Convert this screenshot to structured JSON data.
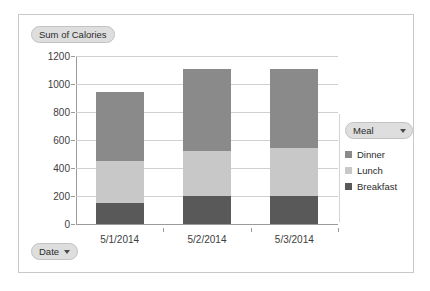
{
  "chart_data": {
    "type": "bar",
    "subtype": "stacked-column",
    "title": "Sum of Calories",
    "xlabel": "Date",
    "ylabel": "",
    "categories": [
      "5/1/2014",
      "5/2/2014",
      "5/3/2014"
    ],
    "series": [
      {
        "name": "Breakfast",
        "values": [
          150,
          200,
          200
        ],
        "color": "#595959"
      },
      {
        "name": "Lunch",
        "values": [
          300,
          320,
          340
        ],
        "color": "#c8c8c8"
      },
      {
        "name": "Dinner",
        "values": [
          490,
          590,
          570
        ],
        "color": "#8a8a8a"
      }
    ],
    "stack_totals": [
      940,
      1110,
      1110
    ],
    "ylim": [
      0,
      1200
    ],
    "y_ticks": [
      "0",
      "200",
      "400",
      "600",
      "800",
      "1000",
      "1200"
    ],
    "y_tick_values": [
      0,
      200,
      400,
      600,
      800,
      1000,
      1200
    ],
    "grid": true,
    "legend_position": "right",
    "legend_title": "Meal",
    "legend_entries": [
      "Dinner",
      "Lunch",
      "Breakfast"
    ]
  },
  "pivot": {
    "value_field_label": "Sum of Calories",
    "row_field_label": "Date",
    "legend_field_label": "Meal",
    "dropdown_glyph": "caret-down"
  },
  "colors": {
    "breakfast": "#595959",
    "lunch": "#c8c8c8",
    "dinner": "#8a8a8a",
    "gridline": "#d0d0d0",
    "axis": "#9b9b9b",
    "frame_border": "#c9c9c9",
    "field_button_bg": "#dedede",
    "field_button_border": "#c2c2c2",
    "text": "#2b2b2b",
    "plot_background": "#ffffff"
  }
}
